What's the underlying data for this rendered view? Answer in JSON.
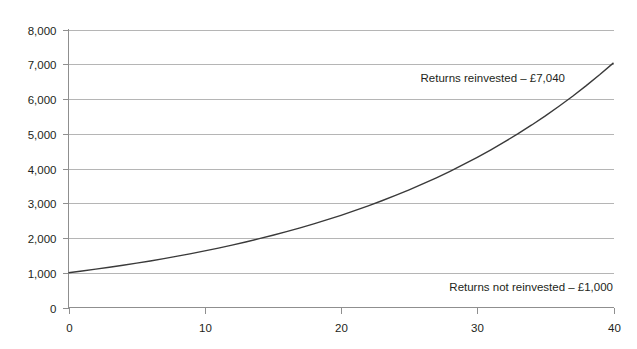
{
  "chart_data": {
    "type": "line",
    "title": "",
    "subtitle": "",
    "xlabel": "",
    "ylabel": "",
    "xlim": [
      0,
      40
    ],
    "ylim": [
      0,
      8000
    ],
    "grid": "horizontal",
    "legend_position": "none",
    "x_ticks": [
      "0",
      "10",
      "20",
      "30",
      "40"
    ],
    "x_tick_values": [
      0,
      10,
      20,
      30,
      40
    ],
    "y_ticks": [
      "0",
      "1,000",
      "2,000",
      "3,000",
      "4,000",
      "5,000",
      "6,000",
      "7,000",
      "8,000"
    ],
    "y_tick_values": [
      0,
      1000,
      2000,
      3000,
      4000,
      5000,
      6000,
      7000,
      8000
    ],
    "series": [
      {
        "name": "Returns reinvested",
        "color": "#3a3a3a",
        "x": [
          0,
          1,
          2,
          3,
          4,
          5,
          6,
          7,
          8,
          9,
          10,
          11,
          12,
          13,
          14,
          15,
          16,
          17,
          18,
          19,
          20,
          21,
          22,
          23,
          24,
          25,
          26,
          27,
          28,
          29,
          30,
          31,
          32,
          33,
          34,
          35,
          36,
          37,
          38,
          39,
          40
        ],
        "values": [
          1000,
          1050,
          1103,
          1158,
          1216,
          1276,
          1340,
          1407,
          1477,
          1551,
          1629,
          1710,
          1796,
          1886,
          1980,
          2079,
          2183,
          2292,
          2407,
          2527,
          2653,
          2786,
          2925,
          3072,
          3225,
          3386,
          3556,
          3733,
          3920,
          4116,
          4322,
          4538,
          4765,
          5003,
          5253,
          5516,
          5792,
          6081,
          6385,
          6705,
          7040
        ]
      }
    ],
    "annotations": [
      {
        "id": "reinvested",
        "text": "Returns reinvested – £7,040",
        "value": 7040,
        "x_px": 565,
        "y_px": 82
      },
      {
        "id": "not-reinvested",
        "text": "Returns not reinvested – £1,000",
        "value": 1000,
        "x_px": 613,
        "y_px": 291
      }
    ],
    "colors": {
      "series": "#3a3a3a",
      "gridline": "#b5b5b5",
      "axis": "#8f8f8f",
      "text": "#231f20",
      "background": "#ffffff"
    }
  }
}
